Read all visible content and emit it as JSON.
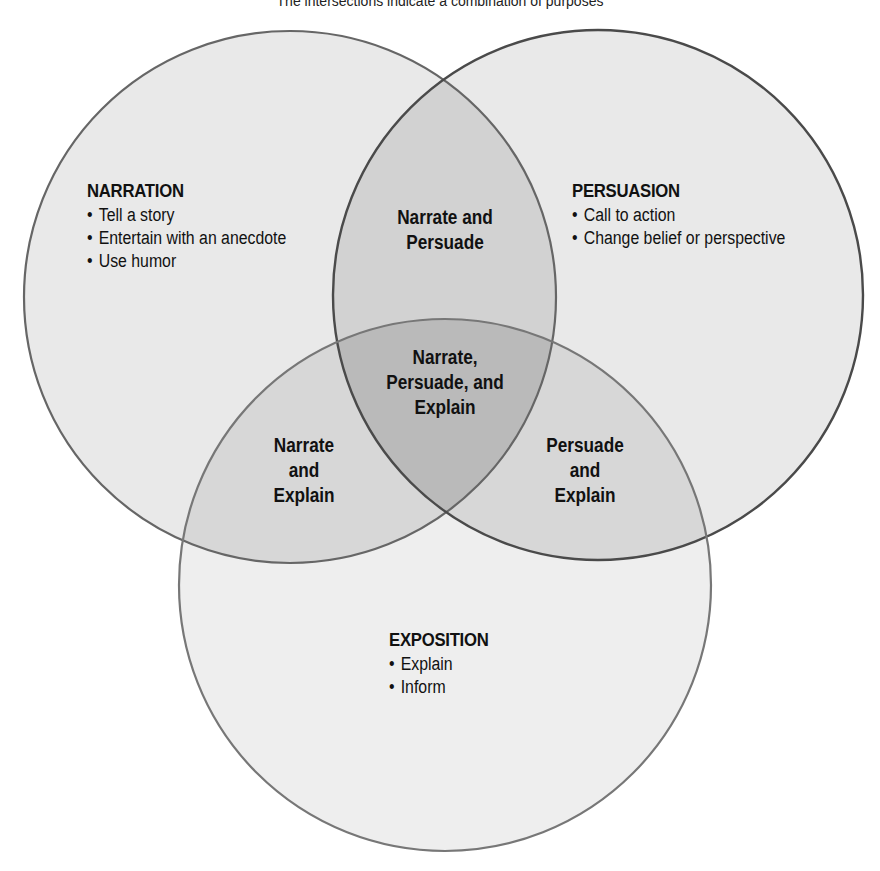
{
  "caption": "The intersections indicate a combination of purposes",
  "colors": {
    "single_fill": "#e7e7e7",
    "double_fill": "#d0d0d0",
    "triple_fill": "#b9b9b9",
    "outline": "#555555",
    "text": "#111111"
  },
  "sets": {
    "narration": {
      "title": "NARRATION",
      "items": [
        "Tell a story",
        "Entertain with an anecdote",
        "Use humor"
      ]
    },
    "persuasion": {
      "title": "PERSUASION",
      "items": [
        "Call to action",
        "Change belief or perspective"
      ]
    },
    "exposition": {
      "title": "EXPOSITION",
      "items": [
        "Explain",
        "Inform"
      ]
    }
  },
  "overlaps": {
    "narrate_persuade": [
      "Narrate and",
      "Persuade"
    ],
    "narrate_explain": [
      "Narrate",
      "and",
      "Explain"
    ],
    "persuade_explain": [
      "Persuade",
      "and",
      "Explain"
    ],
    "all_three": [
      "Narrate,",
      "Persuade, and",
      "Explain"
    ]
  }
}
